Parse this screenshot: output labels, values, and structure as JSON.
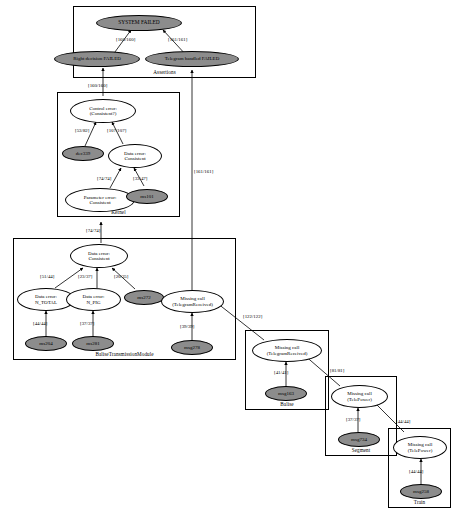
{
  "diagram": {
    "colors": {
      "node_fill": "#8c8c8c",
      "node_stroke": "#000000",
      "background": "#ffffff",
      "edge": "#000000"
    },
    "clusters": [
      {
        "id": "assertions",
        "label": "Assertions"
      },
      {
        "id": "kernel",
        "label": "Kernel"
      },
      {
        "id": "baseline_module",
        "label": "BaliseTransmissionModule"
      },
      {
        "id": "balise",
        "label": "Balise"
      },
      {
        "id": "segment",
        "label": "Segment"
      },
      {
        "id": "train",
        "label": "Train"
      }
    ],
    "nodes": [
      {
        "id": "system_failed",
        "label": "SYSTEM FAILED",
        "style": "filled",
        "cluster": "assertions"
      },
      {
        "id": "right_decision_failed",
        "label": "Right decision FAILED",
        "style": "filled",
        "cluster": "assertions"
      },
      {
        "id": "telegram_handled_failed",
        "label": "Telegram handled FAILED",
        "style": "filled",
        "cluster": "assertions"
      },
      {
        "id": "control_error_consistent",
        "label": "Control error:\n(Consistent?)",
        "style": "plain",
        "cluster": "kernel"
      },
      {
        "id": "dec339",
        "label": "dec339",
        "style": "filled",
        "cluster": "kernel"
      },
      {
        "id": "data_error_consistent_k",
        "label": "Data error:\nConsistent",
        "style": "plain",
        "cluster": "kernel"
      },
      {
        "id": "parameter_error_consistent",
        "label": "Parameter error:\nConsistent",
        "style": "plain",
        "cluster": "kernel"
      },
      {
        "id": "ms101",
        "label": "ms101",
        "style": "filled",
        "cluster": "kernel"
      },
      {
        "id": "data_error_consistent_b",
        "label": "Data error:\nConsistent",
        "style": "plain",
        "cluster": "baseline_module"
      },
      {
        "id": "data_error_n_total",
        "label": "Data error:\nN_TOTAL",
        "style": "plain",
        "cluster": "baseline_module"
      },
      {
        "id": "data_error_n_pig",
        "label": "Data error:\nN_PIG",
        "style": "plain",
        "cluster": "baseline_module"
      },
      {
        "id": "ms272",
        "label": "ms272",
        "style": "filled",
        "cluster": "baseline_module"
      },
      {
        "id": "ms204",
        "label": "ms204",
        "style": "filled",
        "cluster": "baseline_module"
      },
      {
        "id": "ms281",
        "label": "ms281",
        "style": "filled",
        "cluster": "baseline_module"
      },
      {
        "id": "missing_call_tr_b",
        "label": "Missing call\n(TelegramReceived)",
        "style": "plain",
        "cluster": "baseline_module"
      },
      {
        "id": "msg278",
        "label": "msg278",
        "style": "filled",
        "cluster": "baseline_module"
      },
      {
        "id": "missing_call_tr_balise",
        "label": "Missing call\n(TelegramReceived)",
        "style": "plain",
        "cluster": "balise"
      },
      {
        "id": "msg163",
        "label": "msg163",
        "style": "filled",
        "cluster": "balise"
      },
      {
        "id": "missing_call_tp_segment",
        "label": "Missing call\n(TelePower)",
        "style": "plain",
        "cluster": "segment"
      },
      {
        "id": "msg734",
        "label": "msg734",
        "style": "filled",
        "cluster": "segment"
      },
      {
        "id": "missing_call_tp_train",
        "label": "Missing call\n(TelePower)",
        "style": "plain",
        "cluster": "train"
      },
      {
        "id": "msg258",
        "label": "msg258",
        "style": "filled",
        "cluster": "train"
      }
    ],
    "edges": [
      {
        "from": "right_decision_failed",
        "to": "system_failed",
        "label": "[160/160]"
      },
      {
        "from": "telegram_handled_failed",
        "to": "system_failed",
        "label": "[161/161]"
      },
      {
        "from": "control_error_consistent",
        "to": "right_decision_failed",
        "label": "[160/160]"
      },
      {
        "from": "dec339",
        "to": "control_error_consistent",
        "label": "[53/82]"
      },
      {
        "from": "data_error_consistent_k",
        "to": "control_error_consistent",
        "label": "[107/107]"
      },
      {
        "from": "parameter_error_consistent",
        "to": "data_error_consistent_k",
        "label": "[74/74]"
      },
      {
        "from": "ms101",
        "to": "data_error_consistent_k",
        "label": "[33/47]"
      },
      {
        "from": "data_error_consistent_b",
        "to": "parameter_error_consistent",
        "label": "[74/74]"
      },
      {
        "from": "data_error_n_total",
        "to": "data_error_consistent_b",
        "label": "[51/44]"
      },
      {
        "from": "data_error_n_pig",
        "to": "data_error_consistent_b",
        "label": "[23/37]"
      },
      {
        "from": "ms272",
        "to": "data_error_consistent_b",
        "label": "[20/35]"
      },
      {
        "from": "ms204",
        "to": "data_error_n_total",
        "label": "[44/44]"
      },
      {
        "from": "ms281",
        "to": "data_error_n_pig",
        "label": "[37/37]"
      },
      {
        "from": "missing_call_tr_b",
        "to": "telegram_handled_failed",
        "label": "[161/161]"
      },
      {
        "from": "msg278",
        "to": "missing_call_tr_b",
        "label": "[39/39]"
      },
      {
        "from": "missing_call_tr_balise",
        "to": "missing_call_tr_b",
        "label": "[122/122]"
      },
      {
        "from": "msg163",
        "to": "missing_call_tr_balise",
        "label": "[41/41]"
      },
      {
        "from": "missing_call_tp_segment",
        "to": "missing_call_tr_balise",
        "label": "[81/81]"
      },
      {
        "from": "msg734",
        "to": "missing_call_tp_segment",
        "label": "[37/37]"
      },
      {
        "from": "missing_call_tp_train",
        "to": "missing_call_tp_segment",
        "label": "[44/44]"
      },
      {
        "from": "msg258",
        "to": "missing_call_tp_train",
        "label": "[44/44]"
      }
    ]
  }
}
